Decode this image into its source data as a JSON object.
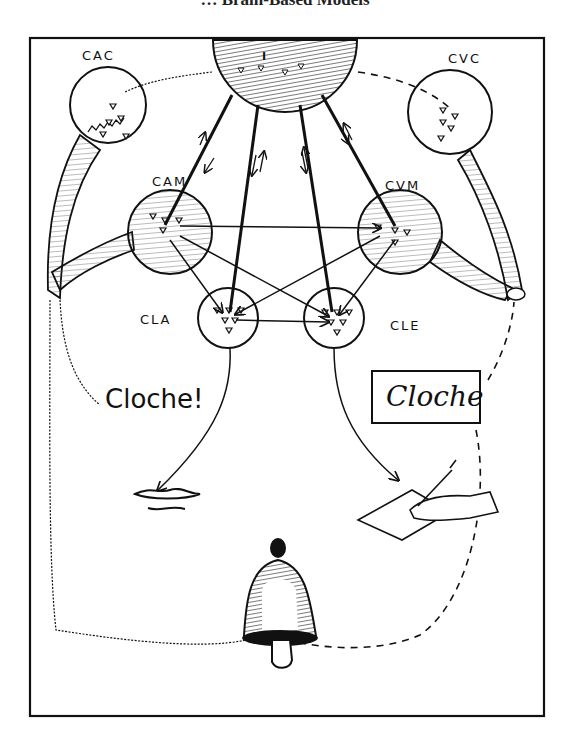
{
  "header": {
    "title_cropped": "… Brain-Based Models"
  },
  "figure": {
    "frame": {
      "x": 30,
      "y": 38,
      "width": 514,
      "height": 678
    },
    "colors": {
      "ink": "#111111",
      "paper": "#ffffff",
      "hatch": "#333333"
    },
    "centers": [
      {
        "id": "CAC",
        "label": "CAC",
        "meaning": "auditory common center",
        "x": 108,
        "y": 105,
        "r": 38
      },
      {
        "id": "CVC",
        "label": "CVC",
        "meaning": "visual common center",
        "x": 450,
        "y": 112,
        "r": 42
      },
      {
        "id": "CAM",
        "label": "CAM",
        "meaning": "auditory word center",
        "x": 170,
        "y": 232,
        "r": 42
      },
      {
        "id": "CVM",
        "label": "CVM",
        "meaning": "visual word center",
        "x": 400,
        "y": 232,
        "r": 42
      },
      {
        "id": "CLA",
        "label": "CLA",
        "meaning": "articulated language center",
        "x": 228,
        "y": 318,
        "r": 30
      },
      {
        "id": "CLE",
        "label": "CLE",
        "meaning": "written language center",
        "x": 334,
        "y": 318,
        "r": 30
      },
      {
        "id": "IC",
        "label": "IC",
        "meaning": "ideation center",
        "x": 285,
        "y": 38,
        "r": 70
      }
    ],
    "texts": {
      "spoken_word": "Cloche!",
      "written_word": "Cloche"
    },
    "objects": [
      "bell",
      "mouth",
      "writing-hand",
      "left-ear",
      "right-eye-nerve"
    ]
  }
}
